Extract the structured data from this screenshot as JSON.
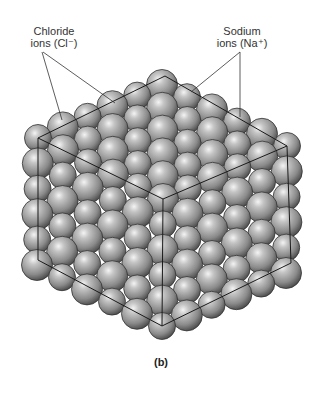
{
  "figure": {
    "caption": "(b)",
    "labels": {
      "chloride": {
        "line1": "Chloride",
        "line2": "ions (Cl⁻)"
      },
      "sodium": {
        "line1": "Sodium",
        "line2": "ions (Na⁺)"
      }
    },
    "colors": {
      "background": "#ffffff",
      "sphere_light": "#e8e8e8",
      "sphere_mid": "#9a9a9a",
      "sphere_dark": "#4a4a4a",
      "outline": "#222222",
      "text": "#333333"
    },
    "cube_vertices": {
      "top": [
        165,
        76
      ],
      "upper_left": [
        38,
        138
      ],
      "upper_right": [
        287,
        146
      ],
      "center": [
        163,
        199
      ],
      "lower_left": [
        38,
        260
      ],
      "lower_right": [
        291,
        263
      ],
      "bottom": [
        162,
        326
      ]
    }
  }
}
